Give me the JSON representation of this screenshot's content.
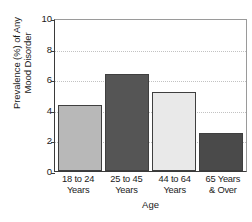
{
  "chart_data": {
    "type": "bar",
    "title": "",
    "categories": [
      "18 to 24 Years",
      "25 to 45 Years",
      "44 to 64 Years",
      "65 Years & Over"
    ],
    "category_lines": [
      [
        "18 to 24",
        "Years"
      ],
      [
        "25 to 45",
        "Years"
      ],
      [
        "44 to 64",
        "Years"
      ],
      [
        "65 Years",
        "& Over"
      ]
    ],
    "values": [
      4.3,
      6.35,
      5.15,
      2.5
    ],
    "xlabel": "Age",
    "ylabel_lines": [
      "Prevalence (%) of Any",
      "Mood Disorder"
    ],
    "ylabel": "Prevalence (%) of Any Mood Disorder",
    "ylim": [
      0,
      10
    ],
    "yticks": [
      0,
      2,
      4,
      6,
      8,
      10
    ],
    "ytick_labels": [
      "0",
      "2",
      "4",
      "6",
      "8",
      "10"
    ],
    "grid": true,
    "legend": false,
    "bar_colors": [
      "#b8b8b8",
      "#555555",
      "#e9e9e9",
      "#4a4a4a"
    ],
    "bar_border_color": "#3f3f3f",
    "axis_color": "#3a3a3a",
    "gridline_color": "#c2c2c2"
  }
}
